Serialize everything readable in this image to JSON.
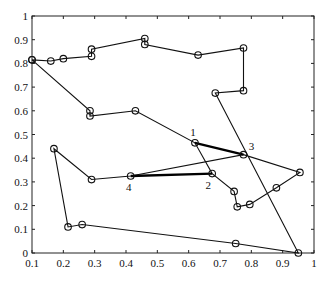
{
  "chart_data": {
    "type": "line",
    "title": "",
    "xlabel": "",
    "ylabel": "",
    "xlim": [
      0.1,
      1
    ],
    "ylim": [
      0,
      1
    ],
    "grid": false,
    "legend": null,
    "x_ticks": [
      "0.1",
      "0.2",
      "0.3",
      "0.4",
      "0.5",
      "0.6",
      "0.7",
      "0.8",
      "0.9",
      "1"
    ],
    "y_ticks": [
      "0",
      "0.1",
      "0.2",
      "0.3",
      "0.4",
      "0.5",
      "0.6",
      "0.7",
      "0.8",
      "0.9",
      "1"
    ],
    "series": [
      {
        "name": "tour",
        "marker": "circle",
        "points": [
          [
            0.1,
            0.815
          ],
          [
            0.16,
            0.81
          ],
          [
            0.2,
            0.82
          ],
          [
            0.29,
            0.83
          ],
          [
            0.29,
            0.86
          ],
          [
            0.46,
            0.905
          ],
          [
            0.46,
            0.88
          ],
          [
            0.63,
            0.835
          ],
          [
            0.775,
            0.865
          ],
          [
            0.775,
            0.685
          ],
          [
            0.685,
            0.675
          ],
          [
            0.95,
            0.0
          ],
          [
            0.75,
            0.04
          ],
          [
            0.26,
            0.12
          ],
          [
            0.215,
            0.11
          ],
          [
            0.17,
            0.44
          ],
          [
            0.29,
            0.31
          ],
          [
            0.415,
            0.325
          ],
          [
            0.775,
            0.415
          ],
          [
            0.955,
            0.34
          ],
          [
            0.88,
            0.275
          ],
          [
            0.795,
            0.205
          ],
          [
            0.755,
            0.195
          ],
          [
            0.745,
            0.26
          ],
          [
            0.675,
            0.335
          ],
          [
            0.62,
            0.465
          ],
          [
            0.43,
            0.6
          ],
          [
            0.285,
            0.578
          ],
          [
            0.285,
            0.6
          ],
          [
            0.1,
            0.815
          ]
        ]
      }
    ],
    "highlighted_edges": [
      {
        "from": "1",
        "to": "3"
      },
      {
        "from": "4",
        "to": "2"
      }
    ],
    "annotations": [
      {
        "text": "1",
        "x": 0.62,
        "y": 0.465
      },
      {
        "text": "2",
        "x": 0.675,
        "y": 0.335
      },
      {
        "text": "3",
        "x": 0.775,
        "y": 0.415
      },
      {
        "text": "4",
        "x": 0.415,
        "y": 0.325
      }
    ]
  }
}
